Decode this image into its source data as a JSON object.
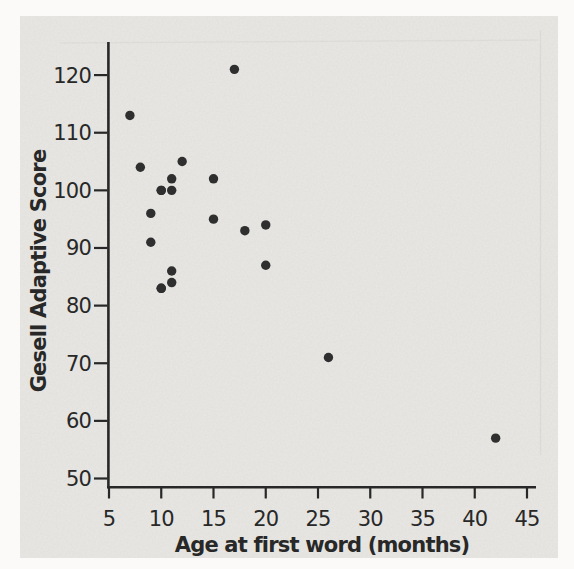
{
  "colors": {
    "page_background": "#fbfaf8",
    "figure_background": "#e9e8e4",
    "ink": "#282828",
    "dot": "#2f2f2f"
  },
  "chart_data": {
    "type": "scatter",
    "title": "",
    "xlabel": "Age at first word (months)",
    "ylabel": "Gesell Adaptive Score",
    "xlim": [
      5,
      45
    ],
    "ylim": [
      50,
      120
    ],
    "xticks": [
      5,
      10,
      15,
      20,
      25,
      30,
      35,
      40,
      45
    ],
    "yticks": [
      50,
      60,
      70,
      80,
      90,
      100,
      110,
      120
    ],
    "grid": false,
    "legend": false,
    "marker": "filled-circle",
    "points": [
      {
        "x": 15,
        "y": 95
      },
      {
        "x": 26,
        "y": 71
      },
      {
        "x": 10,
        "y": 83
      },
      {
        "x": 9,
        "y": 91
      },
      {
        "x": 15,
        "y": 102
      },
      {
        "x": 20,
        "y": 87
      },
      {
        "x": 18,
        "y": 93
      },
      {
        "x": 11,
        "y": 100
      },
      {
        "x": 8,
        "y": 104
      },
      {
        "x": 20,
        "y": 94
      },
      {
        "x": 7,
        "y": 113
      },
      {
        "x": 9,
        "y": 96
      },
      {
        "x": 10,
        "y": 83
      },
      {
        "x": 11,
        "y": 84
      },
      {
        "x": 11,
        "y": 102
      },
      {
        "x": 10,
        "y": 100
      },
      {
        "x": 12,
        "y": 105
      },
      {
        "x": 42,
        "y": 57
      },
      {
        "x": 17,
        "y": 121
      },
      {
        "x": 11,
        "y": 86
      },
      {
        "x": 10,
        "y": 100
      }
    ]
  }
}
